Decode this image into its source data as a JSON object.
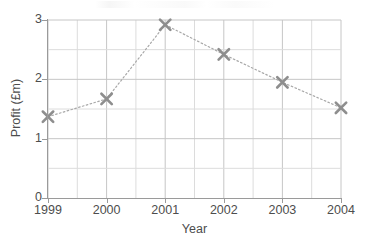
{
  "chart_data": {
    "type": "line",
    "title": "",
    "xlabel": "Year",
    "ylabel": "Profit (£m)",
    "categories": [
      "1999",
      "2000",
      "2001",
      "2002",
      "2003",
      "2004"
    ],
    "x": [
      1999,
      2000,
      2001,
      2002,
      2003,
      2004
    ],
    "values": [
      1.37,
      1.67,
      2.92,
      2.42,
      1.95,
      1.52
    ],
    "series": [
      {
        "name": "Profit",
        "values": [
          1.37,
          1.67,
          2.92,
          2.42,
          1.95,
          1.52
        ]
      }
    ],
    "xlim": [
      1999,
      2004
    ],
    "ylim": [
      0,
      3
    ],
    "y_ticks": [
      "0",
      "1",
      "2",
      "3"
    ],
    "y_tick_values": [
      0,
      1,
      2,
      3
    ],
    "y_minor_ticks": [
      0.5,
      1.5,
      2.5
    ],
    "x_minor_step": 0.5,
    "grid": true,
    "legend": "none",
    "marker": "x-cross",
    "line_style": "dotted",
    "colors": {
      "marker": "#8e8e8e",
      "line": "#a8a8a8",
      "grid_major": "#c6c6c6",
      "grid_minor": "#dcdcdc",
      "axis": "#9a9a9a",
      "text": "#4d4d4d",
      "background": "#ffffff"
    }
  },
  "axes": {
    "x_title": "Year",
    "y_title": "Profit (£m)"
  }
}
